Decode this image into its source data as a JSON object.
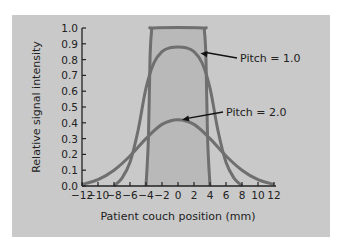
{
  "chart_data": {
    "type": "line",
    "title": "",
    "xlabel": "Patient couch position (mm)",
    "ylabel": "Relative signal intensity",
    "xlim": [
      -12,
      12
    ],
    "ylim": [
      0.0,
      1.0
    ],
    "x_ticks": [
      -12,
      -10,
      -8,
      -6,
      -4,
      -2,
      0,
      2,
      4,
      6,
      8,
      10,
      12
    ],
    "x_tick_labels": [
      "−12",
      "−10",
      "−8",
      "−6",
      "−4",
      "−2",
      "0",
      "2",
      "4",
      "6",
      "8",
      "10",
      "12"
    ],
    "y_ticks": [
      0.0,
      0.1,
      0.2,
      0.3,
      0.4,
      0.5,
      0.6,
      0.7,
      0.8,
      0.9,
      1.0
    ],
    "y_tick_labels": [
      "0.0",
      "0.1",
      "0.2",
      "0.3",
      "0.4",
      "0.5",
      "0.6",
      "0.7",
      "0.8",
      "0.9",
      "1.0"
    ],
    "grid": false,
    "legend": "none (inline annotations)",
    "series": [
      {
        "name": "Slice profile (collimated)",
        "x": [
          -4,
          -3.7,
          -3.5,
          -3.3,
          -3,
          3,
          3.3,
          3.5,
          3.7,
          4
        ],
        "values": [
          0.0,
          0.3,
          0.8,
          0.98,
          1.0,
          1.0,
          0.98,
          0.8,
          0.3,
          0.0
        ],
        "filled": true
      },
      {
        "name": "Pitch = 1.0",
        "x": [
          -8,
          -7,
          -6,
          -5,
          -4,
          -3,
          -2,
          -1,
          0,
          1,
          2,
          3,
          4,
          5,
          6,
          7,
          8
        ],
        "values": [
          0.0,
          0.05,
          0.15,
          0.35,
          0.62,
          0.78,
          0.85,
          0.875,
          0.88,
          0.875,
          0.85,
          0.78,
          0.62,
          0.35,
          0.15,
          0.05,
          0.0
        ]
      },
      {
        "name": "Pitch = 2.0",
        "x": [
          -12,
          -10,
          -8,
          -6,
          -4,
          -2,
          0,
          2,
          4,
          6,
          8,
          10,
          12
        ],
        "values": [
          0.01,
          0.04,
          0.1,
          0.19,
          0.3,
          0.39,
          0.42,
          0.39,
          0.3,
          0.19,
          0.1,
          0.04,
          0.01
        ]
      }
    ],
    "annotations": [
      {
        "text": "Pitch = 1.0",
        "arrow_to": [
          2.8,
          0.84
        ]
      },
      {
        "text": "Pitch = 2.0",
        "arrow_to": [
          0.5,
          0.42
        ]
      }
    ]
  },
  "colors": {
    "panel": "#c9c9c9",
    "curve": "#6f6f6f",
    "fill": "#b9b9b9",
    "axis": "#222222"
  }
}
